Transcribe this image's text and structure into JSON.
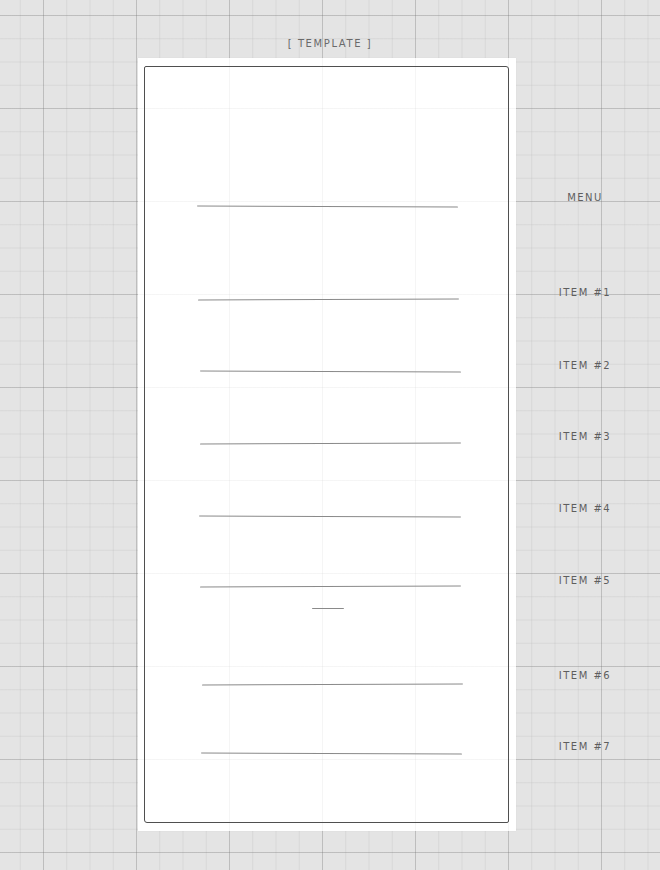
{
  "diagram": {
    "title": "[ TEMPLATE ]",
    "labels": [
      {
        "id": "menu",
        "text": "MENU",
        "y": 192
      },
      {
        "id": "item-1",
        "text": "ITEM #1",
        "y": 287
      },
      {
        "id": "item-2",
        "text": "ITEM #2",
        "y": 360
      },
      {
        "id": "item-3",
        "text": "ITEM #3",
        "y": 431
      },
      {
        "id": "item-4",
        "text": "ITEM #4",
        "y": 503
      },
      {
        "id": "item-5",
        "text": "ITEM #5",
        "y": 575
      },
      {
        "id": "item-6",
        "text": "ITEM #6",
        "y": 670
      },
      {
        "id": "item-7",
        "text": "ITEM #7",
        "y": 741
      }
    ],
    "lines": [
      {
        "id": "menu",
        "x1": 197,
        "x2": 458,
        "y": 206
      },
      {
        "id": "item-1",
        "x1": 198,
        "x2": 459,
        "y": 299
      },
      {
        "id": "item-2",
        "x1": 200,
        "x2": 461,
        "y": 371
      },
      {
        "id": "item-3",
        "x1": 200,
        "x2": 461,
        "y": 443
      },
      {
        "id": "item-4",
        "x1": 199,
        "x2": 461,
        "y": 516
      },
      {
        "id": "item-5",
        "x1": 200,
        "x2": 461,
        "y": 586
      },
      {
        "id": "divider",
        "x1": 312,
        "x2": 344,
        "y": 608
      },
      {
        "id": "item-6",
        "x1": 202,
        "x2": 463,
        "y": 684
      },
      {
        "id": "item-7",
        "x1": 201,
        "x2": 462,
        "y": 753
      }
    ],
    "colors": {
      "background": "#e4e4e4",
      "paper": "#ffffff",
      "stroke": "#4f4f4f",
      "line": "#8a8a8a",
      "text": "#5e5e5e"
    }
  }
}
